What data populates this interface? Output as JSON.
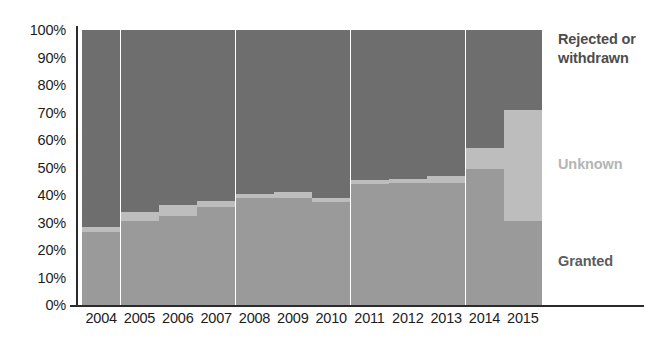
{
  "chart_data": {
    "type": "bar",
    "subtype": "stacked-percentage",
    "title": "",
    "subtitle": "",
    "xlabel": "",
    "ylabel": "",
    "ylim": [
      0,
      100
    ],
    "y_unit": "%",
    "grid": false,
    "orientation": "vertical",
    "legend_position": "right",
    "categories": [
      "2004",
      "2005",
      "2006",
      "2007",
      "2008",
      "2009",
      "2010",
      "2011",
      "2012",
      "2013",
      "2014",
      "2015"
    ],
    "y_ticks": [
      "0%",
      "10%",
      "20%",
      "30%",
      "40%",
      "50%",
      "60%",
      "70%",
      "80%",
      "90%",
      "100%"
    ],
    "y_tick_values": [
      0,
      10,
      20,
      30,
      40,
      50,
      60,
      70,
      80,
      90,
      100
    ],
    "series": [
      {
        "name": "Granted",
        "color": "#9a9a9a",
        "values": [
          26.5,
          30.5,
          32.5,
          35.5,
          39.0,
          39.0,
          37.5,
          44.0,
          44.5,
          44.5,
          49.5,
          30.5
        ]
      },
      {
        "name": "Unknown",
        "color": "#bdbdbd",
        "values": [
          2.0,
          3.5,
          4.0,
          2.5,
          1.5,
          2.0,
          1.5,
          1.5,
          1.5,
          2.5,
          7.5,
          40.5
        ]
      },
      {
        "name": "Rejected or withdrawn",
        "color": "#6e6e6e",
        "values": [
          71.5,
          66.0,
          63.5,
          62.0,
          59.5,
          59.0,
          61.0,
          54.5,
          54.0,
          53.0,
          43.0,
          29.0
        ]
      }
    ],
    "cumulative_tops": {
      "granted": [
        26.5,
        30.5,
        32.5,
        35.5,
        39.0,
        39.0,
        37.5,
        44.0,
        44.5,
        44.5,
        49.5,
        30.5
      ],
      "granted_plus_unknown": [
        28.5,
        34.0,
        36.5,
        38.0,
        40.5,
        41.0,
        39.0,
        45.5,
        46.0,
        47.0,
        57.0,
        71.0
      ]
    }
  },
  "legend": {
    "items": [
      {
        "label": "Rejected or withdrawn",
        "color": "#4d4d4d",
        "top": 30
      },
      {
        "label": "Unknown",
        "color": "#b5b5b5",
        "top": 155
      },
      {
        "label": "Granted",
        "color": "#5c5c5c",
        "top": 252
      }
    ]
  },
  "axis": {
    "line_color": "#2b2b2b",
    "label_color": "#1c1c1c"
  }
}
